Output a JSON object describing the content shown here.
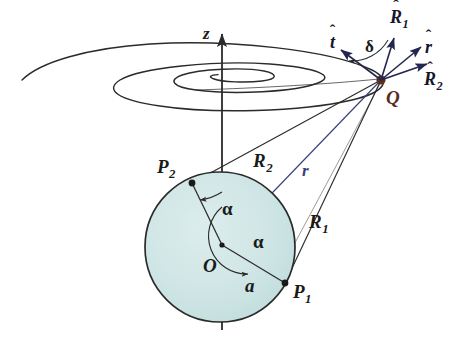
{
  "figure": {
    "background_color": "#ffffff",
    "sphere_fill": "#cfe5e5",
    "sphere_stroke": "#2b2b2b",
    "ray_color_dark": "#2b2b2b",
    "ray_color_blue": "#3a3f7a",
    "vector_color": "#24264f",
    "q_point_color": "#5a3020"
  },
  "axis": {
    "name": "z-axis",
    "label": "z"
  },
  "points": [
    {
      "id": "O",
      "label": "O",
      "sub": "",
      "name": "center-point-o"
    },
    {
      "id": "P1",
      "label": "P",
      "sub": "1",
      "name": "source-point-p1"
    },
    {
      "id": "P2",
      "label": "P",
      "sub": "2",
      "name": "source-point-p2"
    },
    {
      "id": "Q",
      "label": "Q",
      "sub": "",
      "name": "field-point-q"
    }
  ],
  "distances": [
    {
      "id": "R1",
      "label": "R",
      "sub": "1",
      "name": "distance-r1",
      "from": "P1",
      "to": "Q"
    },
    {
      "id": "R2",
      "label": "R",
      "sub": "2",
      "name": "distance-r2",
      "from": "P2",
      "to": "Q"
    },
    {
      "id": "r",
      "label": "r",
      "sub": "",
      "name": "distance-r",
      "from": "O",
      "to": "Q"
    },
    {
      "id": "a",
      "label": "a",
      "sub": "",
      "name": "radius-a",
      "from": "O",
      "to": "P1"
    }
  ],
  "angles": [
    {
      "id": "alpha_upper",
      "label": "α",
      "name": "angle-alpha-upper"
    },
    {
      "id": "alpha_lower",
      "label": "α",
      "name": "angle-alpha-lower"
    },
    {
      "id": "delta",
      "label": "δ",
      "name": "angle-delta"
    }
  ],
  "unit_vectors": [
    {
      "id": "t_hat",
      "base": "t",
      "sub": "",
      "hat": "ˆ",
      "name": "unit-vector-t-hat"
    },
    {
      "id": "R1_hat",
      "base": "R",
      "sub": "1",
      "hat": "ˆ",
      "name": "unit-vector-r1-hat"
    },
    {
      "id": "r_hat",
      "base": "r",
      "sub": "",
      "hat": "ˆ",
      "name": "unit-vector-r-hat"
    },
    {
      "id": "R2_hat",
      "base": "R",
      "sub": "2",
      "hat": "ˆ",
      "name": "unit-vector-r2-hat"
    }
  ]
}
